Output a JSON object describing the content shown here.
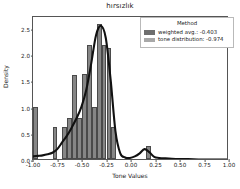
{
  "chart_data": {
    "type": "bar",
    "title": "hırsızlık",
    "xlabel": "Tone Values",
    "ylabel": "Density",
    "xlim": [
      -1.0,
      1.0
    ],
    "ylim": [
      0.0,
      2.75
    ],
    "grid": false,
    "legend_position": "upper right",
    "xticks": [
      "-1.00",
      "-0.75",
      "-0.50",
      "-0.25",
      "0.00",
      "0.25",
      "0.50",
      "0.75",
      "1.00"
    ],
    "xtick_values": [
      -1.0,
      -0.75,
      -0.5,
      -0.25,
      0.0,
      0.25,
      0.5,
      0.75,
      1.0
    ],
    "yticks": [
      "0.0",
      "0.5",
      "1.0",
      "1.5",
      "2.0",
      "2.5"
    ],
    "ytick_values": [
      0.0,
      0.5,
      1.0,
      1.5,
      2.0,
      2.5
    ],
    "bin_edges": [
      -1.0,
      -0.95,
      -0.9,
      -0.85,
      -0.8,
      -0.75,
      -0.7,
      -0.65,
      -0.6,
      -0.55,
      -0.5,
      -0.45,
      -0.4,
      -0.35,
      -0.3,
      -0.25,
      -0.2,
      -0.15,
      -0.1,
      -0.05,
      0.0,
      0.05,
      0.1,
      0.15,
      0.2,
      0.25
    ],
    "values": [
      1.0,
      0.0,
      0.0,
      0.0,
      0.62,
      0.0,
      0.62,
      0.78,
      1.6,
      0.78,
      1.62,
      2.17,
      1.0,
      2.57,
      2.17,
      2.12,
      0.62,
      0.0,
      0.0,
      0.0,
      0.0,
      0.0,
      0.0,
      0.25,
      0.0
    ],
    "series": [
      {
        "name": "weighted avg.: -0.403",
        "type": "kde-curve",
        "color": "#111111",
        "x": [
          -1.0,
          -0.95,
          -0.9,
          -0.85,
          -0.8,
          -0.75,
          -0.7,
          -0.65,
          -0.6,
          -0.55,
          -0.5,
          -0.45,
          -0.4,
          -0.35,
          -0.3,
          -0.25,
          -0.2,
          -0.15,
          -0.1,
          -0.05,
          0.0,
          0.05,
          0.1,
          0.15,
          0.2,
          0.25,
          0.3,
          0.4,
          0.5,
          0.6,
          0.75,
          1.0
        ],
        "y": [
          0.06,
          0.07,
          0.08,
          0.1,
          0.13,
          0.2,
          0.33,
          0.46,
          0.62,
          0.8,
          1.02,
          1.35,
          1.85,
          2.4,
          2.58,
          2.35,
          1.55,
          0.55,
          0.12,
          0.04,
          0.03,
          0.06,
          0.12,
          0.2,
          0.14,
          0.05,
          0.03,
          0.02,
          0.01,
          0.01,
          0.0,
          0.0
        ]
      },
      {
        "name": "tone distribution: -0.974",
        "type": "histogram",
        "color": "#868686"
      }
    ]
  },
  "legend": {
    "title": "Method",
    "entries": [
      {
        "label": "weighted avg.: -0.403",
        "color": "#6e6e6e"
      },
      {
        "label": "tone distribution: -0.974",
        "color": "#a8a8a8"
      }
    ]
  }
}
